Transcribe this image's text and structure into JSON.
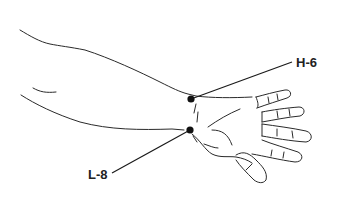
{
  "diagram": {
    "stroke_color": "#2a2a2a",
    "point_color": "#111111",
    "points": [
      {
        "id": "H-6",
        "label": "H-6",
        "x": 191,
        "y": 99,
        "label_x": 296,
        "label_y": 56,
        "leader_end_x": 292,
        "leader_end_y": 62
      },
      {
        "id": "L-8",
        "label": "L-8",
        "x": 190,
        "y": 130,
        "label_x": 88,
        "label_y": 169,
        "leader_end_x": 112,
        "leader_end_y": 173
      }
    ]
  }
}
